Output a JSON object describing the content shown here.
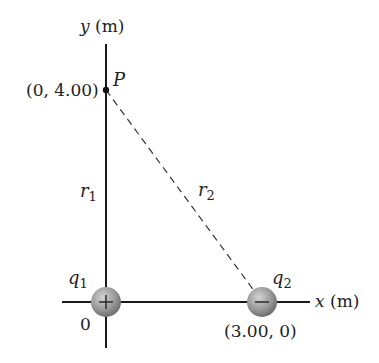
{
  "diagram": {
    "y_axis_label_var": "y",
    "y_axis_label_unit": " (m)",
    "x_axis_label_var": "x",
    "x_axis_label_unit": " (m)",
    "origin_label": "0",
    "point": {
      "name": "P",
      "coords_label": "(0, 4.00)"
    },
    "distances": {
      "r1_base": "r",
      "r1_sub": "1",
      "r2_base": "r",
      "r2_sub": "2"
    },
    "charges": [
      {
        "base": "q",
        "sub": "1",
        "sign": "+",
        "coords_label": ""
      },
      {
        "base": "q",
        "sub": "2",
        "sign": "−",
        "coords_label": "(3.00, 0)"
      }
    ],
    "colors": {
      "axis": "#1a1a1a",
      "charge_fill": "#9a9a9a",
      "text": "#222222"
    }
  }
}
